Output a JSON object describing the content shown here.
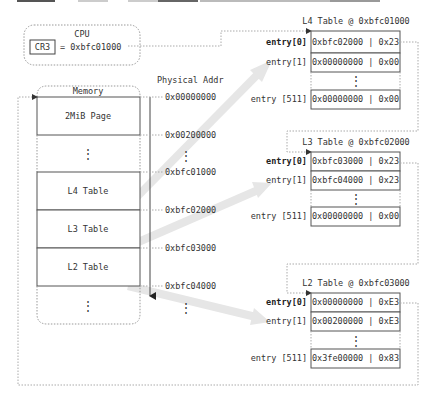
{
  "cpu": {
    "title": "CPU",
    "register": "CR3",
    "value": "= 0xbfc01000"
  },
  "memory": {
    "title": "Memory",
    "physical_addr_header": "Physical Addr",
    "blocks": [
      {
        "label": "2MiB Page"
      },
      {
        "label": "⋮"
      },
      {
        "label": "L4 Table"
      },
      {
        "label": "L3 Table"
      },
      {
        "label": "L2 Table"
      },
      {
        "label": "⋮"
      }
    ],
    "addresses": [
      "0x00000000",
      "0x00200000",
      "0xbfc01000",
      "0xbfc02000",
      "0xbfc03000",
      "0xbfc04000"
    ],
    "address_ellipsis_1": "⋮",
    "address_ellipsis_2": "⋮"
  },
  "tables": [
    {
      "title": "L4 Table @ 0xbfc01000",
      "rows": [
        {
          "label": "entry[0]",
          "value": "0xbfc02000 | 0x23",
          "bold": true
        },
        {
          "label": "entry[1]",
          "value": "0x00000000 | 0x00",
          "bold": false
        },
        {
          "label": "",
          "value": "⋮",
          "bold": false
        },
        {
          "label": "entry [511]",
          "value": "0x00000000 | 0x00",
          "bold": false
        }
      ]
    },
    {
      "title": "L3 Table @ 0xbfc02000",
      "rows": [
        {
          "label": "entry[0]",
          "value": "0xbfc03000 | 0x23",
          "bold": true
        },
        {
          "label": "entry[1]",
          "value": "0xbfc04000 | 0x23",
          "bold": false
        },
        {
          "label": "",
          "value": "⋮",
          "bold": false
        },
        {
          "label": "entry [511]",
          "value": "0x00000000 | 0x00",
          "bold": false
        }
      ]
    },
    {
      "title": "L2 Table @ 0xbfc03000",
      "rows": [
        {
          "label": "entry[0]",
          "value": "0x00000000 | 0xE3",
          "bold": true
        },
        {
          "label": "entry[1]",
          "value": "0x00200000 | 0xE3",
          "bold": false
        },
        {
          "label": "",
          "value": "⋮",
          "bold": false
        },
        {
          "label": "entry [511]",
          "value": "0x3fe00000 | 0x83",
          "bold": false
        }
      ]
    }
  ],
  "colors": {
    "line": "#555555",
    "dashed": "#aaaaaa",
    "arrow_fill": "#e6e6e6",
    "text": "#333333"
  }
}
